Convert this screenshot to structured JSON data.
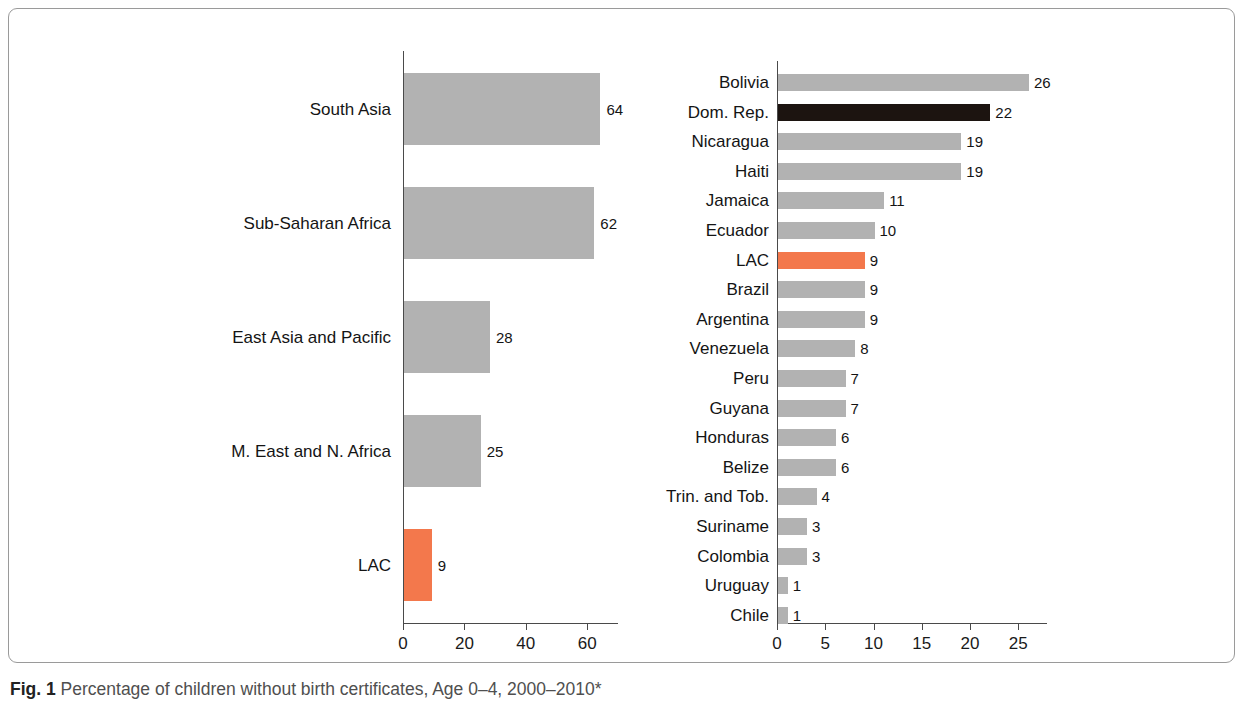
{
  "caption": {
    "label": "Fig. 1",
    "text": "Percentage of children without birth certificates, Age 0–4, 2000–2010*"
  },
  "colors": {
    "bar_gray": "#b2b2b2",
    "bar_accent_orange": "#f3784c",
    "bar_dark": "#1c1410",
    "axis": "#4a4a4a",
    "text": "#141414",
    "caption_text": "#4f4f4f",
    "frame_border": "#9a9a9a"
  },
  "chart_data": [
    {
      "type": "bar",
      "orientation": "horizontal",
      "name": "regions",
      "title": "",
      "xlabel": "",
      "ylabel": "",
      "xlim": [
        0,
        70
      ],
      "xticks": [
        0,
        20,
        40,
        60
      ],
      "grid": false,
      "legend": "none",
      "categories": [
        "South Asia",
        "Sub-Saharan Africa",
        "East Asia and Pacific",
        "M. East and N. Africa",
        "LAC"
      ],
      "values": [
        64,
        62,
        28,
        25,
        9
      ],
      "highlight": [
        "LAC"
      ],
      "highlight_color": "#f3784c"
    },
    {
      "type": "bar",
      "orientation": "horizontal",
      "name": "countries",
      "title": "",
      "xlabel": "",
      "ylabel": "",
      "xlim": [
        0,
        28
      ],
      "xticks": [
        0,
        5,
        10,
        15,
        20,
        25
      ],
      "grid": false,
      "legend": "none",
      "categories": [
        "Bolivia",
        "Dom. Rep.",
        "Nicaragua",
        "Haiti",
        "Jamaica",
        "Ecuador",
        "LAC",
        "Brazil",
        "Argentina",
        "Venezuela",
        "Peru",
        "Guyana",
        "Honduras",
        "Belize",
        "Trin. and Tob.",
        "Suriname",
        "Colombia",
        "Uruguay",
        "Chile"
      ],
      "values": [
        26,
        22,
        19,
        19,
        11,
        10,
        9,
        9,
        9,
        8,
        7,
        7,
        6,
        6,
        4,
        3,
        3,
        1,
        1
      ],
      "highlight": [
        "LAC"
      ],
      "highlight_color": "#f3784c",
      "dark_highlight": [
        "Dom. Rep."
      ],
      "dark_color": "#1c1410"
    }
  ]
}
